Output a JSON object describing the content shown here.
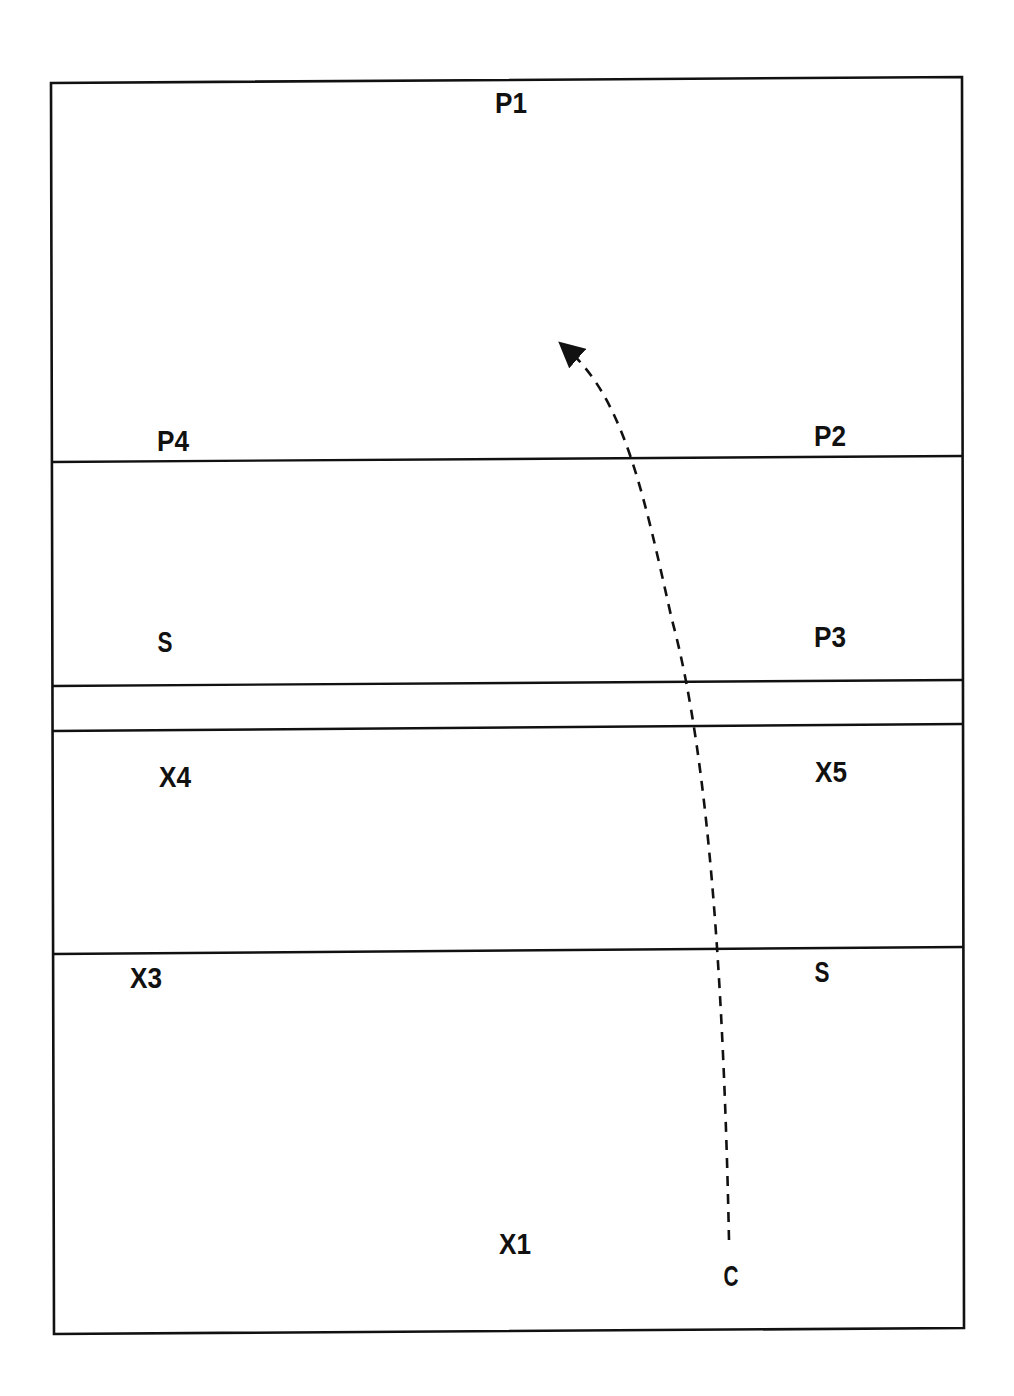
{
  "diagram": {
    "type": "court-positions",
    "colors": {
      "line": "#111111",
      "background": "#ffffff"
    },
    "border": {
      "corners": [
        [
          51,
          83
        ],
        [
          962,
          77
        ],
        [
          964,
          1328
        ],
        [
          54,
          1334
        ]
      ]
    },
    "lines": [
      {
        "id": "line-1",
        "from": [
          51,
          462
        ],
        "to": [
          962,
          456
        ]
      },
      {
        "id": "line-2",
        "from": [
          52,
          686
        ],
        "to": [
          962,
          680
        ]
      },
      {
        "id": "line-3",
        "from": [
          52,
          731
        ],
        "to": [
          962,
          724
        ]
      },
      {
        "id": "line-4",
        "from": [
          53,
          954
        ],
        "to": [
          963,
          947
        ]
      }
    ],
    "labels": [
      {
        "id": "p1",
        "text": "P1",
        "x": 511,
        "y": 113
      },
      {
        "id": "p4",
        "text": "P4",
        "x": 173,
        "y": 451
      },
      {
        "id": "p2",
        "text": "P2",
        "x": 830,
        "y": 446
      },
      {
        "id": "s-left",
        "text": "S",
        "x": 165,
        "y": 652
      },
      {
        "id": "p3",
        "text": "P3",
        "x": 830,
        "y": 647
      },
      {
        "id": "x4",
        "text": "X4",
        "x": 175,
        "y": 787
      },
      {
        "id": "x5",
        "text": "X5",
        "x": 831,
        "y": 782
      },
      {
        "id": "x3",
        "text": "X3",
        "x": 146,
        "y": 988
      },
      {
        "id": "s-right",
        "text": "S",
        "x": 822,
        "y": 982
      },
      {
        "id": "x1",
        "text": "X1",
        "x": 515,
        "y": 1254
      },
      {
        "id": "c",
        "text": "C",
        "x": 731,
        "y": 1286
      }
    ],
    "movement_path": {
      "from_label": "C",
      "style": "dashed",
      "arrowhead": "end",
      "d": "M 729 1240 C 724 1000, 710 760, 672 620 C 645 500, 625 400, 568 350",
      "arrow_tip": [
        555,
        342
      ]
    }
  }
}
